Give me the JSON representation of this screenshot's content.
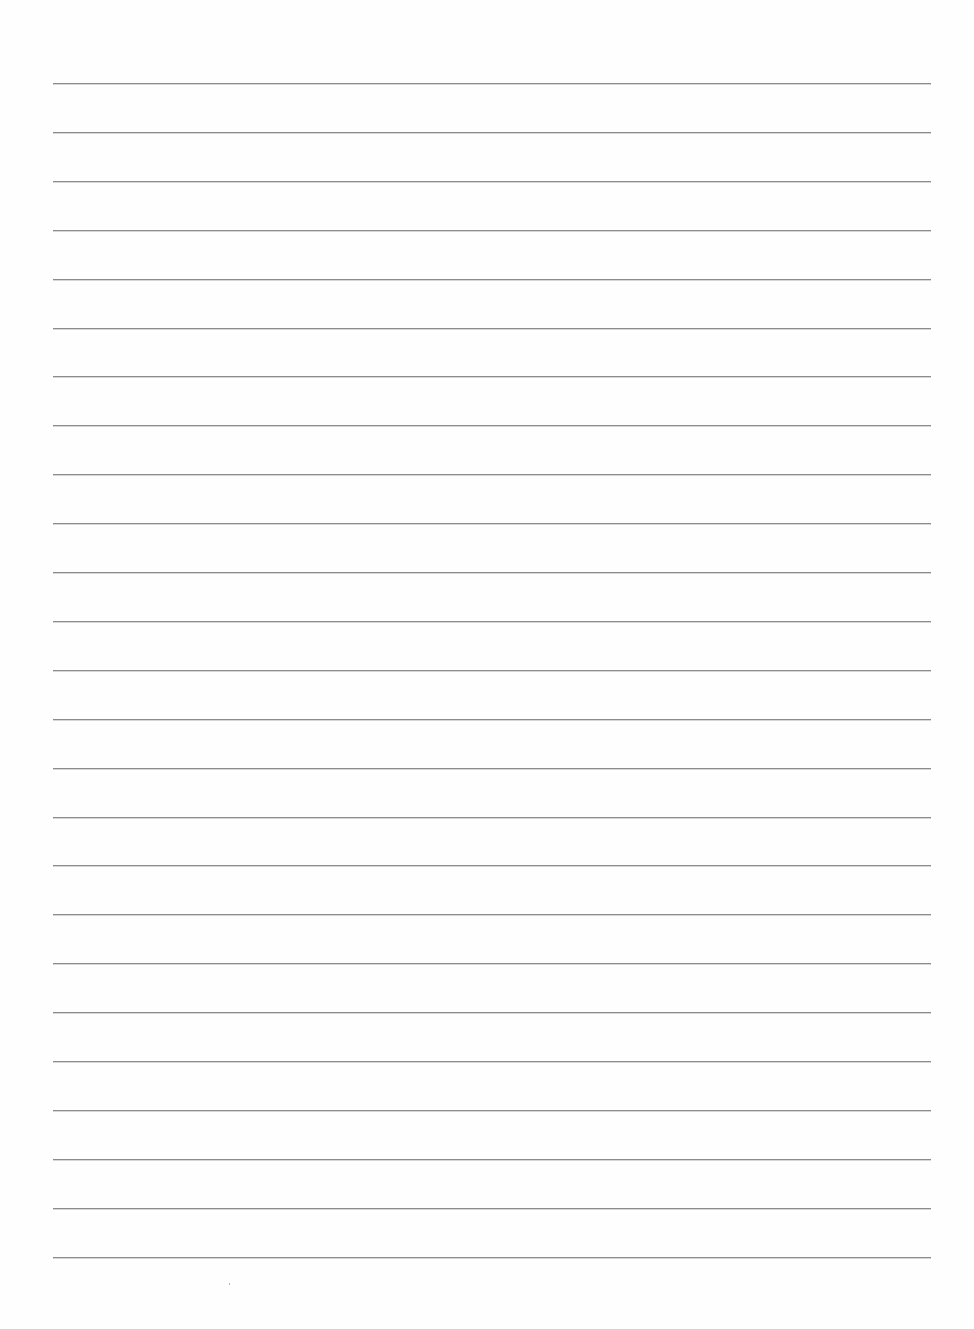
{
  "document": {
    "type": "lined-paper",
    "background_color": "#fefefe",
    "rule_color": "#8c8c8c",
    "rule_count": 25,
    "rule_left": 53,
    "rule_right": 931,
    "first_rule_y": 83,
    "rule_spacing": 48.9,
    "text_content": ""
  }
}
